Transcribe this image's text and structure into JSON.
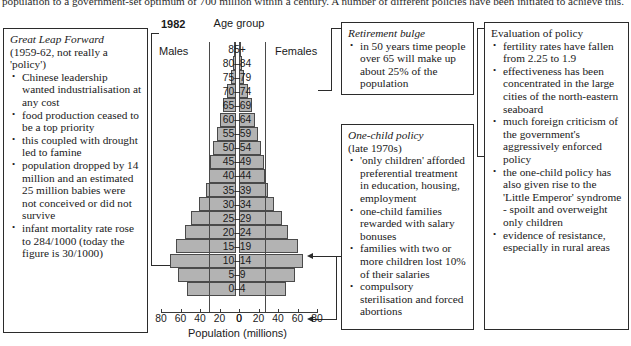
{
  "intro": "population to a government-set optimum of 700 million within a century. A number of different policies have been initiated to achieve this.",
  "chart_data": {
    "type": "bar",
    "title": "1982",
    "subtitle": "Age group",
    "xlabel": "Population (millions)",
    "ylabel": "Age group",
    "left_series_label": "Males",
    "right_series_label": "Females",
    "xlim": [
      0,
      80
    ],
    "ticks_left": [
      "80",
      "60",
      "40",
      "20",
      "0"
    ],
    "ticks_right": [
      "0",
      "20",
      "40",
      "60",
      "80"
    ],
    "grid": false,
    "legend": "none",
    "categories": [
      "85+",
      "80–84",
      "75–79",
      "70–74",
      "65–69",
      "60–64",
      "55–59",
      "50–54",
      "45–49",
      "40–44",
      "35–39",
      "30–34",
      "25–29",
      "20–24",
      "15–19",
      "10–14",
      "5–9",
      "0–4"
    ],
    "series": [
      {
        "name": "Males",
        "values": [
          1,
          3,
          5,
          9,
          13,
          16,
          19,
          24,
          27,
          28,
          31,
          38,
          46,
          52,
          62,
          68,
          60,
          50
        ]
      },
      {
        "name": "Females",
        "values": [
          1,
          3,
          5,
          9,
          13,
          16,
          19,
          23,
          26,
          27,
          30,
          36,
          44,
          50,
          60,
          66,
          57,
          48
        ]
      }
    ]
  },
  "boxes": {
    "great_leap": {
      "title": "Great Leap Forward",
      "subtitle": "(1959-62, not really a 'policy')",
      "bullets": [
        "Chinese leadership wanted industrialisation at any cost",
        "food production ceased to be a top priority",
        "this coupled with drought led to famine",
        "population dropped by 14 million and an estimated 25 million babies were not conceived or did not survive",
        "infant mortality rate rose to 284/1000 (today the figure is 30/1000)"
      ]
    },
    "retirement_bulge": {
      "title": "Retirement bulge",
      "bullets": [
        "in 50 years time people over 65 will make up about 25% of the population"
      ]
    },
    "one_child": {
      "title": "One-child policy",
      "subtitle": "(late 1970s)",
      "bullets": [
        "'only children' afforded preferential treatment in education, housing, employment",
        "one-child families rewarded with salary bonuses",
        "families with two or more children lost 10% of their salaries",
        "compulsory sterilisation and forced abortions"
      ]
    },
    "evaluation": {
      "title": "Evaluation of policy",
      "bullets": [
        "fertility rates have fallen from 2.25 to 1.9",
        "effectiveness has been concentrated in the large cities of the north-eastern seaboard",
        "much foreign criticism of the government's aggressively enforced policy",
        "the one-child policy has also given rise to the 'Little Emperor' syndrome - spoilt and overweight only children",
        "evidence of resistance, especially in rural areas"
      ]
    }
  },
  "colors": {
    "bar_fill": "#b3b3b3",
    "bar_stroke": "#4a4a4a",
    "box_border": "#2b2b2b",
    "text": "#1a1a1a",
    "background": "#ffffff"
  }
}
